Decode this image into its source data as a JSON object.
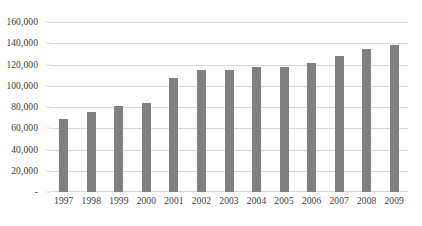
{
  "chart_data": {
    "type": "bar",
    "title": "",
    "subtitle": "",
    "xlabel": "",
    "ylabel": "",
    "categories": [
      "1997",
      "1998",
      "1999",
      "2000",
      "2001",
      "2002",
      "2003",
      "2004",
      "2005",
      "2006",
      "2007",
      "2008",
      "2009"
    ],
    "values": [
      69000,
      75000,
      81000,
      84000,
      107000,
      115000,
      115000,
      118000,
      118000,
      121000,
      128000,
      135000,
      138000
    ],
    "series": [
      {
        "name": "",
        "values": [
          69000,
          75000,
          81000,
          84000,
          107000,
          115000,
          115000,
          118000,
          118000,
          121000,
          128000,
          135000,
          138000
        ]
      }
    ],
    "ylim": [
      0,
      160000
    ],
    "y_ticks": [
      0,
      20000,
      40000,
      60000,
      80000,
      100000,
      120000,
      140000,
      160000
    ],
    "y_tick_labels": [
      "-",
      "20,000",
      "40,000",
      "60,000",
      "80,000",
      "100,000",
      "120,000",
      "140,000",
      "160,000"
    ],
    "grid": true,
    "legend": false,
    "legend_position": "none",
    "bar_color": "#808080",
    "gridline_color": "#D9D9D9",
    "background_color": "#FFFFFF",
    "text_color": "#3B3B3B",
    "annotations": []
  }
}
